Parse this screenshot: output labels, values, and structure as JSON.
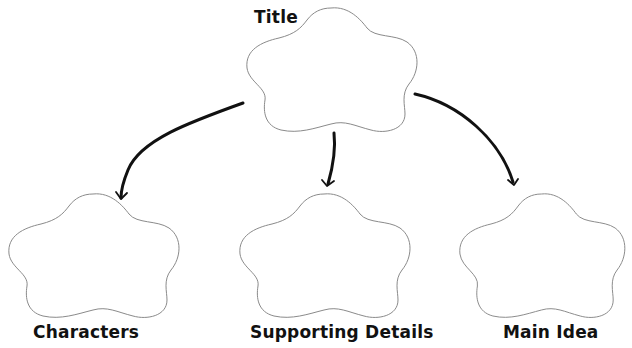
{
  "diagram": {
    "type": "graphic-organizer",
    "nodes": [
      {
        "id": "title",
        "label": "Title",
        "shape": "flower",
        "position": "top-center"
      },
      {
        "id": "characters",
        "label": "Characters",
        "shape": "flower",
        "position": "bottom-left"
      },
      {
        "id": "supporting_details",
        "label": "Supporting Details",
        "shape": "flower",
        "position": "bottom-center"
      },
      {
        "id": "main_idea",
        "label": "Main Idea",
        "shape": "flower",
        "position": "bottom-right"
      }
    ],
    "edges": [
      {
        "from": "title",
        "to": "characters",
        "style": "hand-drawn-arrow"
      },
      {
        "from": "title",
        "to": "supporting_details",
        "style": "hand-drawn-arrow"
      },
      {
        "from": "title",
        "to": "main_idea",
        "style": "hand-drawn-arrow"
      }
    ],
    "colors": {
      "outline": "#8a8a8a",
      "arrow": "#111111",
      "text": "#111111",
      "background": "#ffffff"
    }
  },
  "labels": {
    "title": "Title",
    "characters": "Characters",
    "supporting_details": "Supporting Details",
    "main_idea": "Main Idea"
  }
}
